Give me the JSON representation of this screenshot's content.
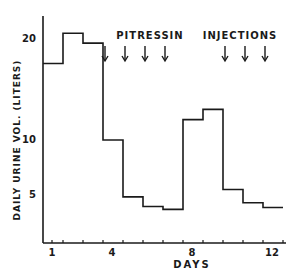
{
  "chart_data": {
    "type": "line",
    "subtype": "step",
    "title": "",
    "xlabel": "DAYS",
    "ylabel": "DAILY URINE VOL. (LITERS)",
    "x": [
      1,
      2,
      3,
      4,
      5,
      6,
      7,
      8,
      9,
      10,
      11,
      12
    ],
    "series": [
      {
        "name": "Daily urine volume",
        "values": [
          17.5,
          20.5,
          19.5,
          10,
          4.8,
          3.8,
          3.5,
          12,
          13,
          5.5,
          4.2,
          3.7
        ]
      }
    ],
    "x_ticks": [
      "1",
      "4",
      "8",
      "12"
    ],
    "y_ticks": [
      "5",
      "10",
      "20"
    ],
    "annotations": [
      {
        "text": "PITRESSIN",
        "arrows_at_days": [
          4,
          5,
          6,
          7
        ]
      },
      {
        "text": "INJECTIONS",
        "arrows_at_days": [
          10,
          11,
          12
        ]
      }
    ],
    "annotation_label": "PITRESSIN INJECTIONS",
    "grid": false,
    "legend": false
  },
  "labels": {
    "xlabel": "DAYS",
    "ylabel": "DAILY URINE VOL. (LITERS)",
    "annot1": "PITRESSIN",
    "annot2": "INJECTIONS",
    "x1": "1",
    "x4": "4",
    "x8": "8",
    "x12": "12",
    "y20": "20",
    "y10": "10",
    "y5": "5"
  }
}
